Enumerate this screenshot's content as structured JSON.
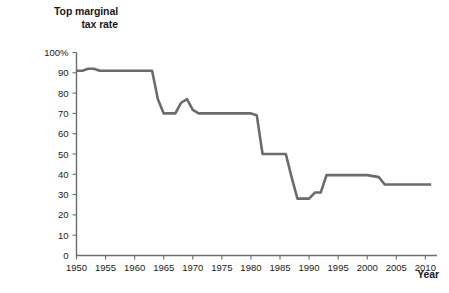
{
  "title": {
    "line1": "Top marginal",
    "line2": "tax rate"
  },
  "xaxis_title": "Year",
  "colors": {
    "line": "#6b6b6b",
    "axis": "#6b6b6b",
    "text": "#1a1a1a",
    "background": "#ffffff"
  },
  "chart_data": {
    "type": "line",
    "title": "Top marginal tax rate",
    "xlabel": "Year",
    "ylabel": "Top marginal tax rate",
    "xlim": [
      1950,
      2012
    ],
    "ylim": [
      0,
      100
    ],
    "grid": false,
    "legend": null,
    "y_unit": "%",
    "x_tick_labels": [
      "1950",
      "1955",
      "1960",
      "1965",
      "1970",
      "1975",
      "1980",
      "1985",
      "1990",
      "1995",
      "2000",
      "2005",
      "2010"
    ],
    "x_ticks": [
      1950,
      1955,
      1960,
      1965,
      1970,
      1975,
      1980,
      1985,
      1990,
      1995,
      2000,
      2005,
      2010
    ],
    "y_tick_labels": [
      "0",
      "10",
      "20",
      "30",
      "40",
      "50",
      "60",
      "70",
      "80",
      "90",
      "100%"
    ],
    "y_ticks": [
      0,
      10,
      20,
      30,
      40,
      50,
      60,
      70,
      80,
      90,
      100
    ],
    "series": [
      {
        "name": "Top marginal tax rate",
        "x": [
          1950,
          1951,
          1952,
          1953,
          1954,
          1955,
          1956,
          1957,
          1958,
          1959,
          1960,
          1961,
          1962,
          1963,
          1964,
          1965,
          1966,
          1967,
          1968,
          1969,
          1970,
          1971,
          1972,
          1973,
          1974,
          1975,
          1976,
          1977,
          1978,
          1979,
          1980,
          1981,
          1982,
          1983,
          1984,
          1985,
          1986,
          1987,
          1988,
          1989,
          1990,
          1991,
          1992,
          1993,
          1994,
          1995,
          1996,
          1997,
          1998,
          1999,
          2000,
          2001,
          2002,
          2003,
          2004,
          2005,
          2006,
          2007,
          2008,
          2009,
          2010,
          2011
        ],
        "values": [
          91,
          91,
          92,
          92,
          91,
          91,
          91,
          91,
          91,
          91,
          91,
          91,
          91,
          91,
          77,
          70,
          70,
          70,
          75.25,
          77,
          71.75,
          70,
          70,
          70,
          70,
          70,
          70,
          70,
          70,
          70,
          70,
          69.125,
          50,
          50,
          50,
          50,
          50,
          38.5,
          28,
          28,
          28,
          31,
          31,
          39.6,
          39.6,
          39.6,
          39.6,
          39.6,
          39.6,
          39.6,
          39.6,
          39.1,
          38.6,
          35,
          35,
          35,
          35,
          35,
          35,
          35,
          35,
          35
        ]
      }
    ]
  }
}
